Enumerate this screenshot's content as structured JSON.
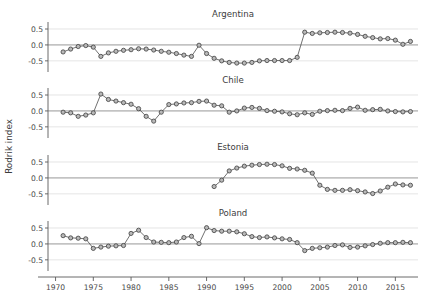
{
  "chart_data": {
    "type": "line",
    "title": "",
    "xlabel": "",
    "ylabel": "Rodrik index",
    "xlim": [
      1969,
      2018
    ],
    "ylim": [
      -0.85,
      0.72
    ],
    "grid": true,
    "legend": "none",
    "xticks": [
      1970,
      1975,
      1980,
      1985,
      1990,
      1995,
      2000,
      2005,
      2010,
      2015
    ],
    "yticks": [
      0.5,
      0.0,
      -0.5
    ],
    "ytick_labels": [
      "0.5",
      "0.0",
      "-0.5"
    ],
    "marker": "open-circle",
    "panels": [
      {
        "name": "Argentina",
        "x": [
          1971,
          1972,
          1973,
          1974,
          1975,
          1976,
          1977,
          1978,
          1979,
          1980,
          1981,
          1982,
          1983,
          1984,
          1985,
          1986,
          1987,
          1988,
          1989,
          1990,
          1991,
          1992,
          1993,
          1994,
          1995,
          1996,
          1997,
          1998,
          1999,
          2000,
          2001,
          2002,
          2003,
          2004,
          2005,
          2006,
          2007,
          2008,
          2009,
          2010,
          2011,
          2012,
          2013,
          2014,
          2015,
          2016,
          2017
        ],
        "y": [
          -0.22,
          -0.13,
          -0.05,
          -0.02,
          -0.07,
          -0.36,
          -0.25,
          -0.2,
          -0.17,
          -0.15,
          -0.12,
          -0.13,
          -0.16,
          -0.2,
          -0.23,
          -0.27,
          -0.32,
          -0.36,
          -0.01,
          -0.27,
          -0.42,
          -0.5,
          -0.55,
          -0.57,
          -0.57,
          -0.55,
          -0.5,
          -0.49,
          -0.49,
          -0.49,
          -0.49,
          -0.39,
          0.4,
          0.36,
          0.38,
          0.39,
          0.4,
          0.39,
          0.37,
          0.33,
          0.27,
          0.23,
          0.19,
          0.2,
          0.15,
          0.02,
          0.11
        ]
      },
      {
        "name": "Chile",
        "x": [
          1971,
          1972,
          1973,
          1974,
          1975,
          1976,
          1977,
          1978,
          1979,
          1980,
          1981,
          1982,
          1983,
          1984,
          1985,
          1986,
          1987,
          1988,
          1989,
          1990,
          1991,
          1992,
          1993,
          1994,
          1995,
          1996,
          1997,
          1998,
          1999,
          2000,
          2001,
          2002,
          2003,
          2004,
          2005,
          2006,
          2007,
          2008,
          2009,
          2010,
          2011,
          2012,
          2013,
          2014,
          2015,
          2016,
          2017
        ],
        "y": [
          -0.04,
          -0.06,
          -0.17,
          -0.13,
          -0.06,
          0.53,
          0.36,
          0.31,
          0.26,
          0.21,
          0.07,
          -0.17,
          -0.32,
          -0.04,
          0.2,
          0.22,
          0.25,
          0.26,
          0.3,
          0.31,
          0.18,
          0.16,
          -0.04,
          0.0,
          0.09,
          0.11,
          0.08,
          0.01,
          -0.01,
          -0.03,
          -0.09,
          -0.12,
          -0.06,
          -0.11,
          -0.01,
          0.01,
          0.02,
          0.01,
          0.08,
          0.12,
          0.02,
          0.04,
          0.05,
          0.0,
          -0.02,
          -0.03,
          -0.02
        ]
      },
      {
        "name": "Estonia",
        "x": [
          1991,
          1992,
          1993,
          1994,
          1995,
          1996,
          1997,
          1998,
          1999,
          2000,
          2001,
          2002,
          2003,
          2004,
          2005,
          2006,
          2007,
          2008,
          2009,
          2010,
          2011,
          2012,
          2013,
          2014,
          2015,
          2016,
          2017
        ],
        "y": [
          -0.27,
          -0.07,
          0.22,
          0.31,
          0.37,
          0.4,
          0.42,
          0.43,
          0.42,
          0.38,
          0.3,
          0.28,
          0.24,
          0.15,
          -0.23,
          -0.36,
          -0.39,
          -0.39,
          -0.37,
          -0.4,
          -0.44,
          -0.49,
          -0.41,
          -0.29,
          -0.19,
          -0.22,
          -0.23
        ]
      },
      {
        "name": "Poland",
        "x": [
          1971,
          1972,
          1973,
          1974,
          1975,
          1976,
          1977,
          1978,
          1979,
          1980,
          1981,
          1982,
          1983,
          1984,
          1985,
          1986,
          1987,
          1988,
          1989,
          1990,
          1991,
          1992,
          1993,
          1994,
          1995,
          1996,
          1997,
          1998,
          1999,
          2000,
          2001,
          2002,
          2003,
          2004,
          2005,
          2006,
          2007,
          2008,
          2009,
          2010,
          2011,
          2012,
          2013,
          2014,
          2015,
          2016,
          2017
        ],
        "y": [
          0.26,
          0.19,
          0.18,
          0.16,
          -0.14,
          -0.1,
          -0.07,
          -0.06,
          -0.05,
          0.33,
          0.43,
          0.2,
          0.06,
          0.05,
          0.04,
          0.06,
          0.2,
          0.24,
          0.01,
          0.51,
          0.42,
          0.4,
          0.4,
          0.38,
          0.32,
          0.23,
          0.2,
          0.22,
          0.19,
          0.16,
          0.14,
          0.04,
          -0.21,
          -0.14,
          -0.12,
          -0.1,
          -0.05,
          -0.03,
          -0.11,
          -0.1,
          -0.06,
          -0.02,
          0.02,
          0.04,
          0.04,
          0.05,
          0.04
        ]
      }
    ]
  },
  "colors": {
    "marker_fill": "#b9b9b9",
    "marker_stroke": "#3d3d3d",
    "line": "#4d4d4d",
    "zero_line": "#8c8c8c",
    "grid": "#d9d9d9",
    "axis": "#5a5a5a",
    "text": "#3c3c3c",
    "background": "#ffffff"
  }
}
